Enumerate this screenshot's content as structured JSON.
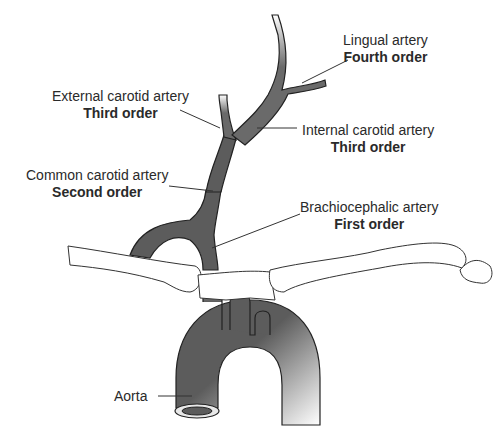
{
  "diagram": {
    "colors": {
      "vessel_fill": "#5c5c5c",
      "vessel_stroke": "#222222",
      "bone_fill": "#ffffff",
      "bone_stroke": "#333333",
      "leader_line": "#333333",
      "text": "#2a2a2a",
      "background": "#ffffff"
    },
    "labels": [
      {
        "id": "lingual",
        "name": "Lingual artery",
        "order": "Fourth order"
      },
      {
        "id": "external-carotid",
        "name": "External carotid artery",
        "order": "Third order"
      },
      {
        "id": "internal-carotid",
        "name": "Internal carotid artery",
        "order": "Third order"
      },
      {
        "id": "common-carotid",
        "name": "Common carotid artery",
        "order": "Second order"
      },
      {
        "id": "brachiocephalic",
        "name": "Brachiocephalic artery",
        "order": "First order"
      },
      {
        "id": "aorta",
        "name": "Aorta",
        "order": ""
      }
    ]
  }
}
